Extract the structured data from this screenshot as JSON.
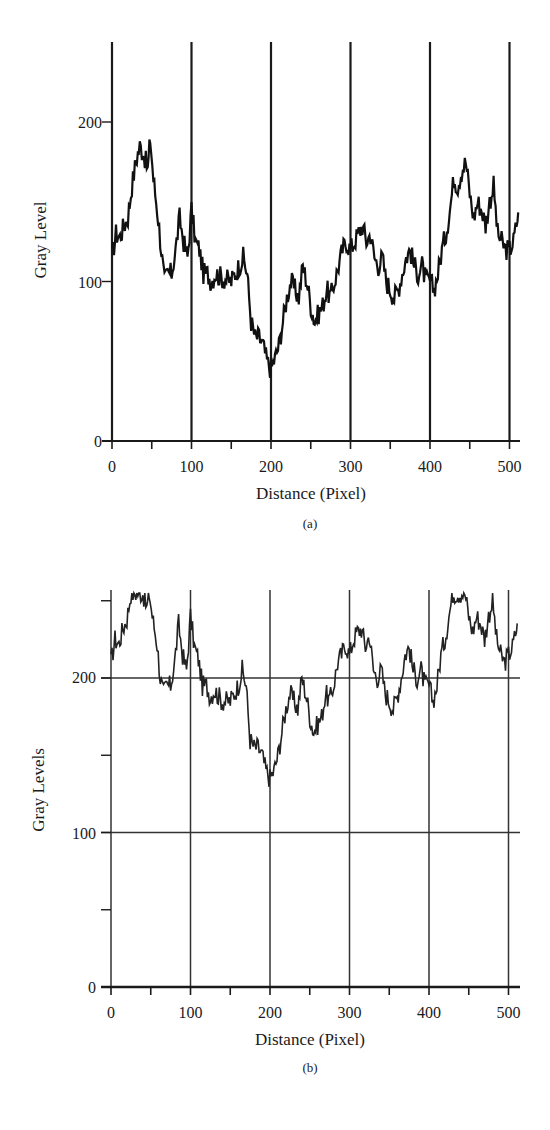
{
  "chart_data": [
    {
      "type": "line",
      "panel": "(a)",
      "title": "",
      "xlabel": "Distance (Pixel)",
      "ylabel": "Gray Level",
      "xlim": [
        0,
        512
      ],
      "ylim": [
        0,
        255
      ],
      "xticks": [
        0,
        100,
        200,
        300,
        400,
        500
      ],
      "xminor_ticks": [
        50,
        150,
        250,
        350,
        450
      ],
      "yticks": [
        0,
        100,
        200
      ],
      "grid": {
        "vertical": [
          0,
          100,
          200,
          300,
          400,
          500
        ],
        "horizontal": []
      },
      "caption": "(a)",
      "series": [
        {
          "name": "Gray level profile",
          "x": [
            0,
            5,
            10,
            15,
            20,
            25,
            30,
            35,
            40,
            45,
            48,
            52,
            58,
            62,
            66,
            70,
            75,
            80,
            85,
            90,
            95,
            100,
            105,
            110,
            115,
            120,
            125,
            130,
            140,
            150,
            160,
            165,
            170,
            175,
            180,
            185,
            190,
            195,
            200,
            205,
            210,
            215,
            220,
            225,
            230,
            235,
            240,
            245,
            250,
            255,
            260,
            265,
            270,
            275,
            280,
            285,
            290,
            295,
            300,
            305,
            310,
            315,
            320,
            325,
            330,
            335,
            340,
            345,
            350,
            355,
            360,
            365,
            370,
            375,
            380,
            385,
            390,
            395,
            400,
            405,
            410,
            415,
            420,
            425,
            430,
            435,
            440,
            445,
            450,
            455,
            460,
            465,
            470,
            475,
            480,
            485,
            490,
            495,
            500,
            505,
            510
          ],
          "values": [
            115,
            130,
            128,
            135,
            140,
            160,
            175,
            185,
            180,
            170,
            190,
            165,
            140,
            120,
            100,
            105,
            105,
            120,
            140,
            125,
            115,
            145,
            125,
            120,
            105,
            105,
            100,
            105,
            102,
            100,
            110,
            115,
            105,
            75,
            65,
            65,
            60,
            50,
            45,
            52,
            60,
            75,
            90,
            100,
            95,
            90,
            110,
            100,
            85,
            75,
            80,
            85,
            95,
            90,
            100,
            110,
            120,
            125,
            120,
            125,
            130,
            135,
            125,
            130,
            115,
            110,
            115,
            100,
            95,
            90,
            95,
            105,
            115,
            120,
            110,
            105,
            110,
            100,
            100,
            95,
            105,
            120,
            130,
            145,
            165,
            160,
            170,
            175,
            155,
            140,
            150,
            145,
            135,
            150,
            160,
            130,
            125,
            120,
            120,
            125,
            140
          ]
        }
      ]
    },
    {
      "type": "line",
      "panel": "(b)",
      "title": "",
      "xlabel": "Distance (Pixel)",
      "ylabel": "Gray Levels",
      "xlim": [
        0,
        512
      ],
      "ylim": [
        0,
        255
      ],
      "xticks": [
        0,
        100,
        200,
        300,
        400,
        500
      ],
      "xminor_ticks": [
        50,
        150,
        250,
        350,
        450
      ],
      "yticks": [
        0,
        100,
        200
      ],
      "yminor_ticks": [
        50,
        150,
        250
      ],
      "grid": {
        "vertical": [
          0,
          100,
          200,
          300,
          400,
          500
        ],
        "horizontal": [
          100,
          200
        ]
      },
      "caption": "(b)",
      "series": [
        {
          "name": "Gray level profile (brightened, clipped at 255)",
          "x": [
            0,
            5,
            10,
            15,
            20,
            25,
            30,
            35,
            40,
            45,
            48,
            52,
            58,
            62,
            66,
            70,
            75,
            80,
            85,
            90,
            95,
            100,
            105,
            110,
            115,
            120,
            125,
            130,
            140,
            150,
            160,
            165,
            170,
            175,
            180,
            185,
            190,
            195,
            200,
            205,
            210,
            215,
            220,
            225,
            230,
            235,
            240,
            245,
            250,
            255,
            260,
            265,
            270,
            275,
            280,
            285,
            290,
            295,
            300,
            305,
            310,
            315,
            320,
            325,
            330,
            335,
            340,
            345,
            350,
            355,
            360,
            365,
            370,
            375,
            380,
            385,
            390,
            395,
            400,
            405,
            410,
            415,
            420,
            425,
            430,
            435,
            440,
            445,
            450,
            455,
            460,
            465,
            470,
            475,
            480,
            485,
            490,
            495,
            500,
            505,
            510
          ],
          "values": [
            210,
            225,
            222,
            232,
            238,
            255,
            255,
            255,
            255,
            245,
            255,
            240,
            222,
            200,
            190,
            195,
            195,
            210,
            235,
            215,
            205,
            240,
            220,
            212,
            195,
            195,
            188,
            192,
            185,
            185,
            195,
            205,
            195,
            160,
            155,
            155,
            150,
            140,
            135,
            140,
            150,
            165,
            180,
            190,
            185,
            180,
            200,
            190,
            175,
            165,
            170,
            175,
            190,
            185,
            195,
            210,
            215,
            222,
            215,
            225,
            230,
            232,
            220,
            228,
            205,
            200,
            205,
            190,
            185,
            180,
            188,
            200,
            215,
            220,
            205,
            200,
            205,
            195,
            195,
            185,
            195,
            215,
            225,
            240,
            255,
            255,
            255,
            255,
            240,
            230,
            240,
            235,
            225,
            240,
            250,
            225,
            215,
            210,
            215,
            220,
            232
          ]
        }
      ]
    }
  ],
  "figures": {
    "a": {
      "ylabel": "Gray Level",
      "xlabel": "Distance (Pixel)",
      "caption": "(a)",
      "yticks": [
        "200",
        "100",
        "0"
      ],
      "xticks": [
        "0",
        "100",
        "200",
        "300",
        "400",
        "500"
      ]
    },
    "b": {
      "ylabel": "Gray Levels",
      "xlabel": "Distance (Pixel)",
      "caption": "(b)",
      "yticks": [
        "200",
        "100",
        "0"
      ],
      "xticks": [
        "0",
        "100",
        "200",
        "300",
        "400",
        "500"
      ]
    }
  },
  "colors": {
    "line": "#111111",
    "axis": "#1a1a1a",
    "grid": "#333333",
    "background": "#ffffff"
  }
}
